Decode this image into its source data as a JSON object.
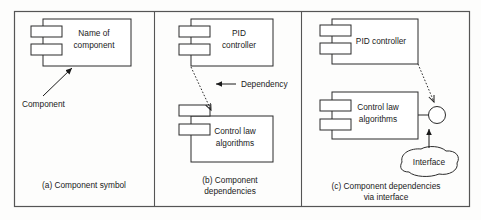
{
  "figure": {
    "panels": [
      {
        "id": "panel-a",
        "caption": "(a) Component symbol",
        "components": [
          {
            "name": "component-symbol",
            "label_line1": "Name of",
            "label_line2": "component"
          }
        ],
        "annotations": [
          {
            "name": "component-annotation",
            "label": "Component"
          }
        ]
      },
      {
        "id": "panel-b",
        "caption_line1": "(b) Component",
        "caption_line2": "dependencies",
        "components": [
          {
            "name": "pid-controller",
            "label_line1": "PID",
            "label_line2": "controller"
          },
          {
            "name": "control-law-algorithms",
            "label_line1": "Control law",
            "label_line2": "algorithms"
          }
        ],
        "annotations": [
          {
            "name": "dependency-annotation",
            "label": "Dependency"
          }
        ]
      },
      {
        "id": "panel-c",
        "caption_line1": "(c) Component dependencies",
        "caption_line2": "via interface",
        "components": [
          {
            "name": "pid-controller",
            "label": "PID controller"
          },
          {
            "name": "control-law-algorithms",
            "label_line1": "Control law",
            "label_line2": "algorithms"
          }
        ],
        "annotations": [
          {
            "name": "interface-annotation",
            "label": "Interface"
          }
        ]
      }
    ]
  },
  "colors": {
    "background": "#fdfdfc",
    "stroke": "#2b2b2b",
    "frame_stroke": "#555555",
    "text": "#1a1a1a",
    "box_fill": "#ffffff"
  }
}
